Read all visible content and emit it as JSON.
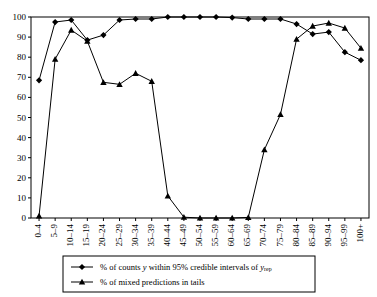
{
  "chart_data": {
    "type": "line",
    "title": "",
    "xlabel": "",
    "ylabel": "",
    "ylim": [
      0,
      100
    ],
    "ytick_step": 10,
    "grid": false,
    "legend_position": "bottom",
    "categories": [
      "0–4",
      "5–9",
      "10–14",
      "15–19",
      "20–24",
      "25–29",
      "30–34",
      "35–39",
      "40–44",
      "45–49",
      "50–54",
      "55–59",
      "60–64",
      "65–69",
      "70–74",
      "75–79",
      "80–84",
      "85–89",
      "90–94",
      "95–99",
      "100+"
    ],
    "yticks": [
      0,
      10,
      20,
      30,
      40,
      50,
      60,
      70,
      80,
      90,
      100
    ],
    "series": [
      {
        "name": "% of counts y within 95% credible intervals of y_rep",
        "marker": "diamond",
        "color": "#000000",
        "values": [
          68.5,
          97.5,
          98.5,
          88.5,
          91,
          98.5,
          99,
          99,
          100,
          100,
          100,
          100,
          99.7,
          99,
          99,
          99,
          96.5,
          91.5,
          92.5,
          82.5,
          78.5
        ]
      },
      {
        "name": "% of mixed predictions in tails",
        "marker": "triangle",
        "color": "#000000",
        "values": [
          1,
          79,
          93.5,
          88,
          67.5,
          66.5,
          72,
          68,
          11,
          0.4,
          0,
          0,
          0,
          0.3,
          34,
          51.5,
          89,
          95.5,
          97,
          94.5,
          84.5
        ]
      }
    ]
  },
  "legend": {
    "items": [
      {
        "marker": "diamond",
        "label_parts": [
          {
            "text": "% of counts ",
            "style": "normal"
          },
          {
            "text": "y",
            "style": "italic"
          },
          {
            "text": " within 95% credible intervals of ",
            "style": "normal"
          },
          {
            "text": "y",
            "style": "italic"
          },
          {
            "text": "rep",
            "style": "subscript"
          }
        ],
        "label_plain": "% of counts y within 95% credible intervals of y rep"
      },
      {
        "marker": "triangle",
        "label_parts": [
          {
            "text": "% of mixed predictions in tails",
            "style": "normal"
          }
        ],
        "label_plain": "% of mixed predictions in tails"
      }
    ]
  },
  "axes": {
    "y_axis_min_label": "0",
    "y_axis_max_label": "100"
  }
}
